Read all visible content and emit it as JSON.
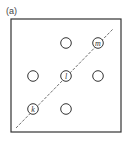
{
  "figure": {
    "panel_label": "(a)",
    "circles": [
      {
        "id": "top-mid",
        "cx": 66,
        "cy": 43,
        "label": ""
      },
      {
        "id": "m",
        "cx": 98,
        "cy": 43,
        "label": "m"
      },
      {
        "id": "mid-left",
        "cx": 33,
        "cy": 76,
        "label": ""
      },
      {
        "id": "l",
        "cx": 66,
        "cy": 76,
        "label": "l"
      },
      {
        "id": "mid-right",
        "cx": 98,
        "cy": 76,
        "label": ""
      },
      {
        "id": "k",
        "cx": 33,
        "cy": 109,
        "label": "k"
      },
      {
        "id": "bot-mid",
        "cx": 66,
        "cy": 109,
        "label": ""
      }
    ],
    "diagonal": {
      "x1": 16,
      "y1": 128,
      "x2": 113,
      "y2": 29,
      "style": "dashed"
    },
    "frame": {
      "x": 11,
      "y": 19,
      "w": 110,
      "h": 113
    },
    "colors": {
      "stroke": "#333333"
    }
  }
}
